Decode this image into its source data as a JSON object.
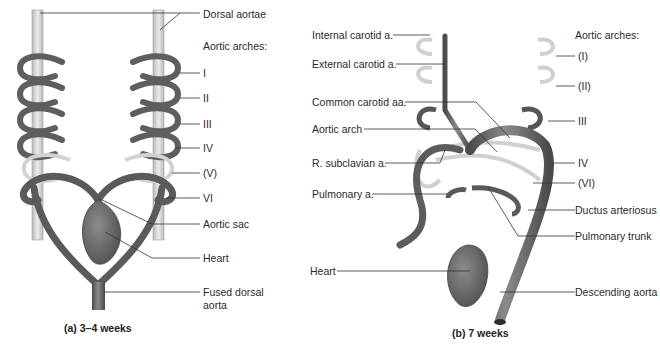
{
  "figure": {
    "panel_a": {
      "caption": "(a) 3–4 weeks",
      "labels": {
        "dorsal_aortae": "Dorsal aortae",
        "aortic_arches_heading": "Aortic arches:",
        "arch_1": "I",
        "arch_2": "II",
        "arch_3": "III",
        "arch_4": "IV",
        "arch_5": "(V)",
        "arch_6": "VI",
        "aortic_sac": "Aortic sac",
        "heart": "Heart",
        "fused_dorsal_aorta_line1": "Fused dorsal",
        "fused_dorsal_aorta_line2": "aorta"
      }
    },
    "panel_b": {
      "caption": "(b) 7 weeks",
      "labels": {
        "internal_carotid": "Internal carotid a.",
        "external_carotid": "External carotid a.",
        "common_carotid": "Common carotid aa.",
        "aortic_arch": "Aortic arch",
        "r_subclavian": "R. subclavian a.",
        "pulmonary_a": "Pulmonary a.",
        "heart": "Heart",
        "aortic_arches_heading": "Aortic arches:",
        "arch_1": "(I)",
        "arch_2": "(II)",
        "arch_3": "III",
        "arch_4": "IV",
        "arch_6": "(VI)",
        "ductus_arteriosus": "Ductus arteriosus",
        "pulmonary_trunk": "Pulmonary trunk",
        "descending_aorta": "Descending aorta"
      }
    },
    "colors": {
      "vessel": "#6e6e6e",
      "vessel_dark": "#4a4a4a",
      "vessel_light": "#c9c9c9",
      "regressed": "#d6d6d6",
      "leader_line": "#333333",
      "text": "#2a2a2a"
    }
  }
}
